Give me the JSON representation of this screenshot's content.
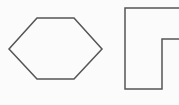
{
  "canvas": {
    "width": 179,
    "height": 105,
    "background": "#fbfbfb"
  },
  "shapes": [
    {
      "name": "hexagon",
      "points": "37,18 74,18 102,49 74,79 37,79 9,49",
      "stroke": "#555555",
      "stroke_width": 1.5,
      "fill": "none"
    },
    {
      "name": "l-shape",
      "points": "125,8 181,8 181,39 162,39 162,89 125,89",
      "stroke": "#555555",
      "stroke_width": 1.5,
      "fill": "none"
    }
  ]
}
